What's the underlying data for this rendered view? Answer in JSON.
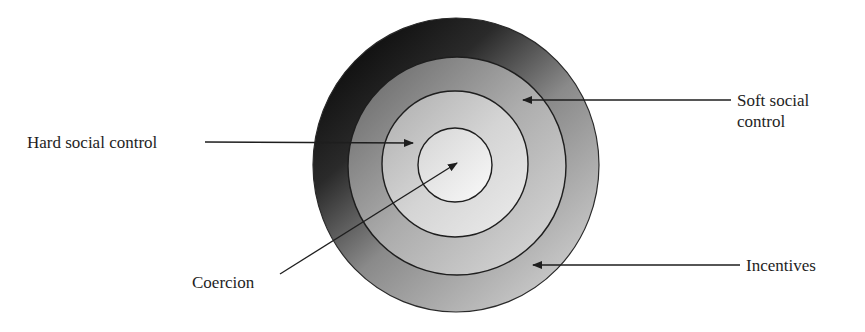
{
  "diagram": {
    "type": "concentric-circles",
    "title": "",
    "rings_outer_to_inner": [
      {
        "id": "incentives",
        "label": "Incentives",
        "radius": 145
      },
      {
        "id": "soft_social_control",
        "label": "Soft social control",
        "radius": 109
      },
      {
        "id": "hard_social_control",
        "label": "Hard social control",
        "radius": 73
      },
      {
        "id": "coercion",
        "label": "Coercion",
        "radius": 37
      }
    ],
    "center": {
      "x": 456,
      "y": 165
    },
    "labels": {
      "hard": "Hard social control",
      "soft_line1": "Soft social",
      "soft_line2": "control",
      "incentives": "Incentives",
      "coercion": "Coercion"
    },
    "colors": {
      "outer_dark": "#151515",
      "outer_light": "#c4c4c4",
      "ring2_dark": "#7a7a7a",
      "ring2_light": "#d2d2d2",
      "ring3_dark": "#b8b8b8",
      "ring3_light": "#e6e6e6",
      "inner_dark": "#dcdcdc",
      "inner_light": "#f6f6f6",
      "stroke": "#2a2a2a",
      "text": "#1e1e1e"
    }
  }
}
